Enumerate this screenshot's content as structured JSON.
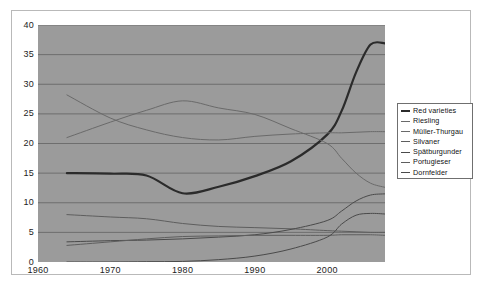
{
  "chart_data": {
    "type": "line",
    "title": "",
    "subtitle": "",
    "xlabel": "",
    "ylabel": "",
    "xlim": [
      1960,
      2008
    ],
    "ylim": [
      0,
      40
    ],
    "xticks": [
      1960,
      1970,
      1980,
      1990,
      2000
    ],
    "yticks": [
      0,
      5,
      10,
      15,
      20,
      25,
      30,
      35,
      40
    ],
    "grid": true,
    "legend_position": "right",
    "background": "#9b9b9b",
    "x": [
      1964,
      1970,
      1975,
      1980,
      1985,
      1990,
      1995,
      2000,
      2002,
      2004,
      2006,
      2008
    ],
    "series": [
      {
        "name": "Red varieties",
        "color": "#2b2b2b",
        "width": 2.2,
        "values": [
          15.0,
          14.9,
          14.6,
          11.6,
          12.7,
          14.5,
          17.0,
          21.5,
          25.5,
          32.0,
          36.7,
          36.9
        ]
      },
      {
        "name": "Riesling",
        "color": "#6a6a6a",
        "width": 1.0,
        "values": [
          28.2,
          24.3,
          22.3,
          21.0,
          20.6,
          21.2,
          21.6,
          21.8,
          21.8,
          21.9,
          22.0,
          22.0
        ]
      },
      {
        "name": "Müller-Thurgau",
        "color": "#6a6a6a",
        "width": 1.0,
        "values": [
          21.0,
          23.6,
          25.6,
          27.2,
          26.0,
          24.9,
          22.5,
          20.0,
          17.5,
          15.0,
          13.3,
          12.6
        ]
      },
      {
        "name": "Silvaner",
        "color": "#5e5e5e",
        "width": 1.0,
        "values": [
          8.0,
          7.6,
          7.3,
          6.5,
          6.0,
          5.8,
          5.6,
          5.3,
          5.2,
          5.1,
          5.0,
          5.0
        ]
      },
      {
        "name": "Spätburgunder",
        "color": "#4a4a4a",
        "width": 1.0,
        "values": [
          3.4,
          3.6,
          3.7,
          3.9,
          4.2,
          4.6,
          5.5,
          7.0,
          8.6,
          10.3,
          11.3,
          11.5
        ]
      },
      {
        "name": "Portugieser",
        "color": "#5e5e5e",
        "width": 1.0,
        "values": [
          2.8,
          3.4,
          3.9,
          4.3,
          4.4,
          4.5,
          4.5,
          4.5,
          4.6,
          4.6,
          4.6,
          4.5
        ]
      },
      {
        "name": "Dornfelder",
        "color": "#4a4a4a",
        "width": 1.0,
        "values": [
          0.0,
          0.0,
          0.05,
          0.1,
          0.4,
          1.0,
          2.2,
          4.2,
          6.4,
          7.9,
          8.2,
          8.1
        ]
      }
    ]
  },
  "legend": {
    "items": [
      {
        "label": "Red varieties"
      },
      {
        "label": "Riesling"
      },
      {
        "label": "Müller-Thurgau"
      },
      {
        "label": "Silvaner"
      },
      {
        "label": "Spätburgunder"
      },
      {
        "label": "Portugieser"
      },
      {
        "label": "Dornfelder"
      }
    ]
  }
}
